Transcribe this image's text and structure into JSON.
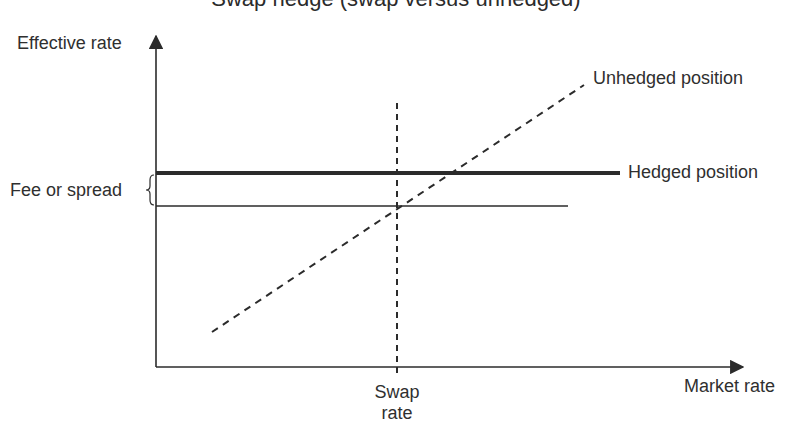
{
  "title": "Swap hedge (swap versus unhedged)",
  "axes": {
    "y_label": "Effective rate",
    "x_label": "Market rate"
  },
  "annotations": {
    "fee_or_spread": "Fee or spread",
    "swap_rate_line1": "Swap",
    "swap_rate_line2": "rate"
  },
  "series": {
    "unhedged": {
      "label": "Unhedged position",
      "style": "dashed"
    },
    "hedged": {
      "label": "Hedged position",
      "style": "thick-solid"
    },
    "swap_rate_baseline": {
      "label": "",
      "style": "thin-solid"
    }
  },
  "colors": {
    "line": "#2b2b2b",
    "text": "#2f2f2f",
    "background": "#ffffff"
  }
}
